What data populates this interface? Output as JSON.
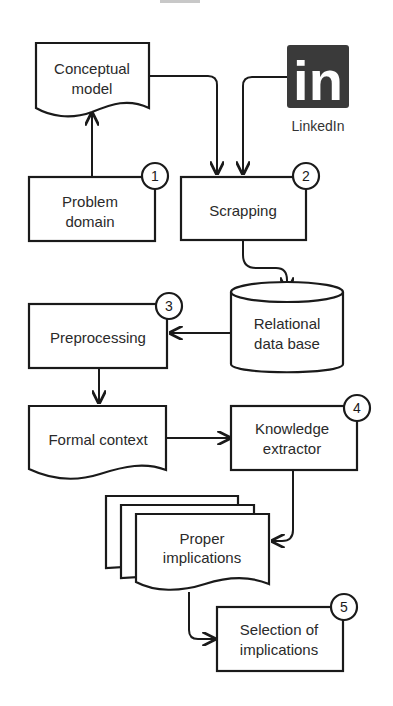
{
  "diagram": {
    "nodes": {
      "conceptual_model": {
        "lines": [
          "Conceptual",
          "model"
        ],
        "shape": "document"
      },
      "linkedin": {
        "logo_text": "in",
        "label": "LinkedIn",
        "shape": "logo"
      },
      "problem_domain": {
        "lines": [
          "Problem",
          "domain"
        ],
        "step": "1",
        "shape": "process"
      },
      "scrapping": {
        "lines": [
          "Scrapping"
        ],
        "step": "2",
        "shape": "process"
      },
      "relational_db": {
        "lines": [
          "Relational",
          "data base"
        ],
        "shape": "database"
      },
      "preprocessing": {
        "lines": [
          "Preprocessing"
        ],
        "step": "3",
        "shape": "process"
      },
      "formal_context": {
        "lines": [
          "Formal context"
        ],
        "shape": "document"
      },
      "knowledge_extractor": {
        "lines": [
          "Knowledge",
          "extractor"
        ],
        "step": "4",
        "shape": "process"
      },
      "proper_implications": {
        "lines": [
          "Proper",
          "implications"
        ],
        "shape": "multi-document"
      },
      "selection_implications": {
        "lines": [
          "Selection of",
          "implications"
        ],
        "step": "5",
        "shape": "process"
      }
    },
    "edges": [
      {
        "from": "problem_domain",
        "to": "conceptual_model"
      },
      {
        "from": "conceptual_model",
        "to": "scrapping"
      },
      {
        "from": "linkedin",
        "to": "scrapping"
      },
      {
        "from": "scrapping",
        "to": "relational_db"
      },
      {
        "from": "relational_db",
        "to": "preprocessing"
      },
      {
        "from": "preprocessing",
        "to": "formal_context"
      },
      {
        "from": "formal_context",
        "to": "knowledge_extractor"
      },
      {
        "from": "knowledge_extractor",
        "to": "proper_implications"
      },
      {
        "from": "proper_implications",
        "to": "selection_implications"
      }
    ],
    "colors": {
      "stroke": "#1a1a1a",
      "logo_bg": "#3a3a3a",
      "logo_fg": "#ffffff"
    }
  }
}
